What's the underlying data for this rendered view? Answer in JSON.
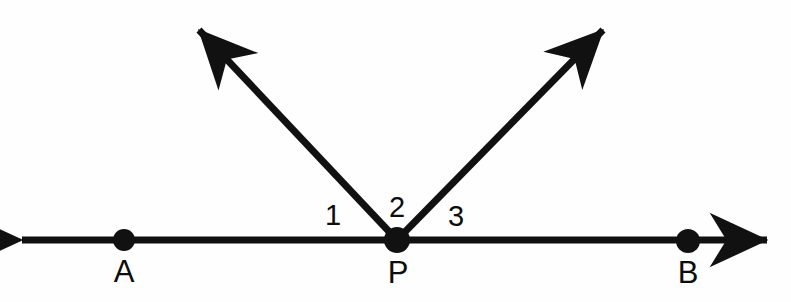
{
  "figure": {
    "background_color": "#fefefe",
    "stroke_color": "#111111",
    "width": 791,
    "height": 302
  },
  "points": [
    {
      "id": "A",
      "label": "A",
      "x": 124,
      "y": 240,
      "label_x": 124,
      "label_y": 271,
      "dot_radius": 11
    },
    {
      "id": "P",
      "label": "P",
      "x": 397,
      "y": 240,
      "label_x": 398,
      "label_y": 272,
      "dot_radius": 13
    },
    {
      "id": "B",
      "label": "B",
      "x": 688,
      "y": 241,
      "label_x": 688,
      "label_y": 272,
      "dot_radius": 12
    }
  ],
  "line": {
    "name": "line-AB",
    "y": 240,
    "left_tip_x": 14,
    "right_tip_x": 775,
    "stroke_width": 7,
    "double_headed": true
  },
  "rays": [
    {
      "id": "ray-1",
      "name": "ray-upper-left",
      "from_x": 397,
      "from_y": 240,
      "to_x": 190,
      "to_y": 20,
      "stroke_width": 7
    },
    {
      "id": "ray-2",
      "name": "ray-upper-right",
      "from_x": 397,
      "from_y": 240,
      "to_x": 612,
      "to_y": 20,
      "stroke_width": 7
    }
  ],
  "angle_labels": [
    {
      "id": "angle-1",
      "label": "1",
      "x": 333,
      "y": 215
    },
    {
      "id": "angle-2",
      "label": "2",
      "x": 397,
      "y": 207
    },
    {
      "id": "angle-3",
      "label": "3",
      "x": 456,
      "y": 216
    }
  ]
}
